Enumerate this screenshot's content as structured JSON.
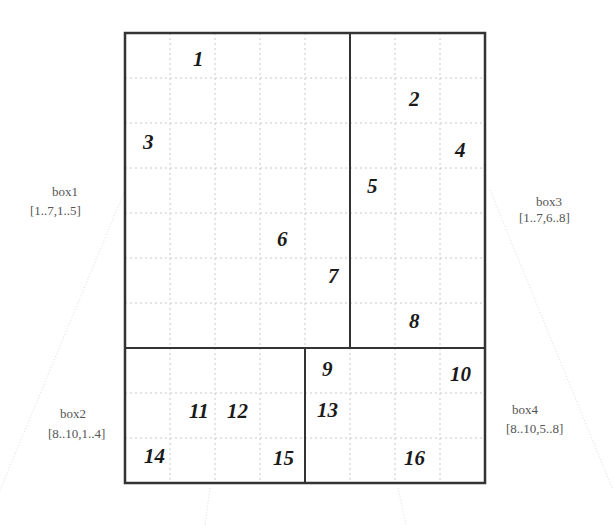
{
  "grid": {
    "rows": 10,
    "cols": 8,
    "origin": [
      125,
      33
    ],
    "cell_size": 45
  },
  "numbers": [
    {
      "label": "1",
      "x": 193,
      "y": 66
    },
    {
      "label": "2",
      "x": 409,
      "y": 106
    },
    {
      "label": "3",
      "x": 143,
      "y": 149
    },
    {
      "label": "4",
      "x": 455,
      "y": 157
    },
    {
      "label": "5",
      "x": 367,
      "y": 193
    },
    {
      "label": "6",
      "x": 277,
      "y": 246
    },
    {
      "label": "7",
      "x": 328,
      "y": 283
    },
    {
      "label": "8",
      "x": 409,
      "y": 328
    },
    {
      "label": "9",
      "x": 322,
      "y": 376
    },
    {
      "label": "10",
      "x": 450,
      "y": 381
    },
    {
      "label": "11",
      "x": 189,
      "y": 418
    },
    {
      "label": "12",
      "x": 227,
      "y": 418
    },
    {
      "label": "13",
      "x": 317,
      "y": 417
    },
    {
      "label": "14",
      "x": 144,
      "y": 463
    },
    {
      "label": "15",
      "x": 273,
      "y": 465
    },
    {
      "label": "16",
      "x": 404,
      "y": 465
    }
  ],
  "boxes": [
    {
      "name": "box1",
      "range": "[1..7,1..5]",
      "name_x": 52,
      "name_y": 196,
      "range_x": 30,
      "range_y": 215
    },
    {
      "name": "box3",
      "range": "[1..7,6..8]",
      "name_x": 536,
      "name_y": 206,
      "range_x": 519,
      "range_y": 222
    },
    {
      "name": "box2",
      "range": "[8..10,1..4]",
      "name_x": 60,
      "name_y": 418,
      "range_x": 48,
      "range_y": 438
    },
    {
      "name": "box4",
      "range": "[8..10,5..8]",
      "name_x": 512,
      "name_y": 414,
      "range_x": 506,
      "range_y": 433
    }
  ],
  "colors": {
    "frame": "#333333",
    "grid": "#c8c8c8",
    "number": "#1a1a1a",
    "label": "#555555"
  }
}
